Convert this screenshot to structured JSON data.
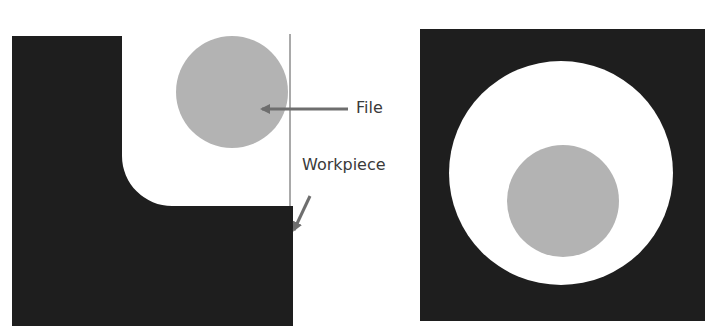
{
  "diagram": {
    "left_panel": {
      "labels": {
        "file": "File",
        "workpiece": "Workpiece"
      }
    },
    "right_panel": {}
  },
  "colors": {
    "workpiece": "#1e1e1e",
    "file": "#b3b3b3",
    "background": "#ffffff",
    "arrow": "#6e6e6e"
  }
}
